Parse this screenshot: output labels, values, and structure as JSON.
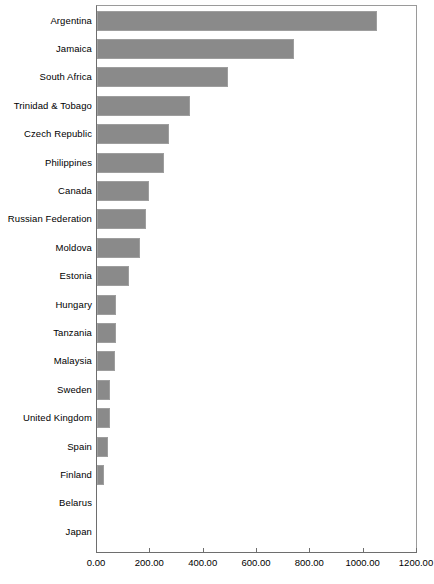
{
  "chart_data": {
    "type": "bar",
    "orientation": "horizontal",
    "title": "",
    "subtitle": "",
    "xlabel": "",
    "ylabel": "",
    "xlim": [
      0,
      1200
    ],
    "xticks": [
      0,
      200,
      400,
      600,
      800,
      1000,
      1200
    ],
    "xtick_labels": [
      "0.00",
      "200.00",
      "400.00",
      "600.00",
      "800.00",
      "1000.00",
      "1200.00"
    ],
    "grid": false,
    "legend": null,
    "bar_color": "#8a8a8a",
    "bar_border_color": "#9e9e9e",
    "axis_color": "#6e6e6e",
    "categories": [
      "Argentina",
      "Jamaica",
      "South Africa",
      "Trinidad & Tobago",
      "Czech Republic",
      "Philippines",
      "Canada",
      "Russian Federation",
      "Moldova",
      "Estonia",
      "Hungary",
      "Tanzania",
      "Malaysia",
      "Sweden",
      "United Kingdom",
      "Spain",
      "Finland",
      "Belarus",
      "Japan"
    ],
    "values": [
      1050,
      740,
      490,
      350,
      270,
      250,
      195,
      185,
      160,
      120,
      72,
      70,
      68,
      50,
      50,
      40,
      25,
      0,
      0
    ]
  }
}
